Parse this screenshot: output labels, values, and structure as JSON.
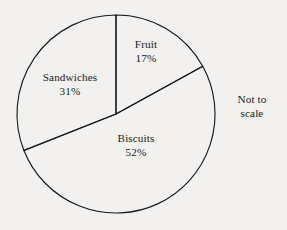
{
  "chart_data": {
    "type": "pie",
    "title": "",
    "categories": [
      "Fruit",
      "Biscuits",
      "Sandwiches"
    ],
    "values": [
      17,
      52,
      31
    ],
    "value_unit": "%",
    "labels": [
      {
        "name": "Fruit",
        "value": "17%"
      },
      {
        "name": "Biscuits",
        "value": "52%"
      },
      {
        "name": "Sandwiches",
        "value": "31%"
      }
    ],
    "start_angle_deg": 0,
    "direction": "clockwise",
    "legend": "none",
    "grid": false,
    "fill": "none",
    "stroke_color": "#1b1b1b",
    "background_color": "#f2f1ef",
    "annotation": {
      "line1": "Not to",
      "line2": "scale"
    }
  },
  "geometry": {
    "center_x": 116,
    "center_y": 114,
    "radius": 99
  },
  "label_positions": [
    {
      "x": 146,
      "y": 52
    },
    {
      "x": 136,
      "y": 146
    },
    {
      "x": 70,
      "y": 85
    }
  ],
  "annotation_position": {
    "x": 252,
    "y": 106
  }
}
